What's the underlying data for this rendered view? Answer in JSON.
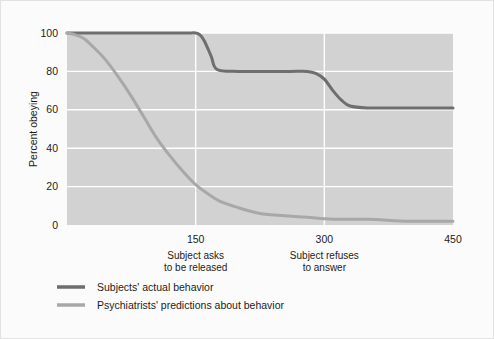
{
  "chart_data": {
    "type": "line",
    "title": "",
    "xlabel": "",
    "ylabel": "Percent obeying",
    "xlim": [
      0,
      450
    ],
    "ylim": [
      0,
      100
    ],
    "grid": true,
    "grid_color": "#ffffff",
    "plot_background": "#d2d2d2",
    "figure_background": "#fbfbfb",
    "xticks": [
      150,
      300,
      450
    ],
    "xtick_labels": [
      "150",
      "300",
      "450"
    ],
    "yticks": [
      0,
      20,
      40,
      60,
      80,
      100
    ],
    "ytick_labels": [
      "0",
      "20",
      "40",
      "60",
      "80",
      "100"
    ],
    "annotations": [
      {
        "at_x": 150,
        "line1": "Subject asks",
        "line2": "to be released"
      },
      {
        "at_x": 300,
        "line1": "Subject refuses",
        "line2": "to answer"
      }
    ],
    "legend_position": "below-left",
    "series": [
      {
        "name": "Subjects' actual behavior",
        "color": "#6e6e6e",
        "x": [
          0,
          30,
          60,
          90,
          120,
          140,
          150,
          155,
          160,
          168,
          175,
          200,
          230,
          260,
          280,
          290,
          300,
          310,
          320,
          330,
          350,
          380,
          410,
          450
        ],
        "values": [
          100,
          100,
          100,
          100,
          100,
          100,
          100,
          99,
          96,
          88,
          81,
          80,
          80,
          80,
          80,
          79,
          76,
          70,
          65,
          62,
          61,
          61,
          61,
          61
        ]
      },
      {
        "name": "Psychiatrists' predictions about behavior",
        "color": "#a8a8a8",
        "x": [
          0,
          10,
          20,
          30,
          45,
          60,
          75,
          90,
          105,
          120,
          135,
          150,
          165,
          180,
          200,
          225,
          250,
          280,
          310,
          350,
          400,
          450
        ],
        "values": [
          100,
          99,
          97,
          93,
          86,
          77,
          67,
          56,
          45,
          36,
          28,
          21,
          16,
          12,
          9,
          6,
          5,
          4,
          3,
          3,
          2,
          2
        ]
      }
    ]
  },
  "legend": {
    "items": [
      {
        "label": "Subjects' actual behavior",
        "color": "#6e6e6e"
      },
      {
        "label": "Psychiatrists' predictions about behavior",
        "color": "#a8a8a8"
      }
    ]
  }
}
